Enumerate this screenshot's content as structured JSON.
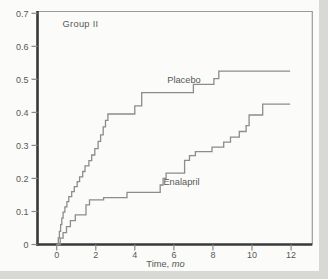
{
  "figure": {
    "background": "#fbfbf9",
    "scan_edge_color": "#d8d8d5"
  },
  "chart_data": {
    "type": "line",
    "subtype": "kaplan-meier-step",
    "title": "Group II",
    "xlabel": "Time,",
    "xlabel_unit": "mo",
    "ylabel": "",
    "xlim": [
      0,
      12
    ],
    "ylim": [
      0,
      0.7
    ],
    "grid": false,
    "legend_position": "inline-curve-labels",
    "axis_color": "#383838",
    "frame_color": "#9a9a9a",
    "tick_color": "#8a8a8a",
    "curve_color": "#8c8c8c",
    "text_color": "#585858",
    "x_ticks": [
      {
        "label": "0",
        "t": 0
      },
      {
        "label": "2",
        "t": 2
      },
      {
        "label": "4",
        "t": 4
      },
      {
        "label": "6",
        "t": 6
      },
      {
        "label": "8",
        "t": 8
      },
      {
        "label": "10",
        "t": 10
      },
      {
        "label": "12",
        "t": 12
      }
    ],
    "y_ticks": [
      {
        "label": "0.7",
        "v": 0.7
      },
      {
        "label": "0.6",
        "v": 0.6
      },
      {
        "label": "0.5",
        "v": 0.5
      },
      {
        "label": "0.4",
        "v": 0.4
      },
      {
        "label": "0.3",
        "v": 0.3
      },
      {
        "label": "0.2",
        "v": 0.2
      },
      {
        "label": "0.1",
        "v": 0.1
      },
      {
        "label": "0",
        "v": 0
      }
    ],
    "annotations": [
      {
        "text": "Group II",
        "t": 1.22,
        "v": 0.66
      }
    ],
    "series": [
      {
        "name": "Placebo",
        "label": {
          "text": "Placebo",
          "t": 6.52,
          "v": 0.489
        },
        "end_t": 11.95,
        "points": [
          [
            0,
            0
          ],
          [
            0.08,
            0.02
          ],
          [
            0.14,
            0.04
          ],
          [
            0.2,
            0.06
          ],
          [
            0.26,
            0.08
          ],
          [
            0.33,
            0.098
          ],
          [
            0.42,
            0.114
          ],
          [
            0.52,
            0.13
          ],
          [
            0.62,
            0.145
          ],
          [
            0.77,
            0.16
          ],
          [
            0.9,
            0.175
          ],
          [
            1.05,
            0.19
          ],
          [
            1.17,
            0.205
          ],
          [
            1.33,
            0.221
          ],
          [
            1.45,
            0.238
          ],
          [
            1.65,
            0.254
          ],
          [
            1.79,
            0.271
          ],
          [
            1.95,
            0.29
          ],
          [
            2.12,
            0.312
          ],
          [
            2.25,
            0.332
          ],
          [
            2.38,
            0.356
          ],
          [
            2.5,
            0.376
          ],
          [
            2.62,
            0.395
          ],
          [
            4.0,
            0.42
          ],
          [
            4.35,
            0.46
          ],
          [
            7.0,
            0.485
          ],
          [
            8.05,
            0.502
          ],
          [
            8.3,
            0.525
          ]
        ]
      },
      {
        "name": "Enalapril",
        "label": {
          "text": "Enalapril",
          "t": 6.39,
          "v": 0.179
        },
        "end_t": 11.95,
        "points": [
          [
            0,
            0
          ],
          [
            0.18,
            0.019
          ],
          [
            0.33,
            0.036
          ],
          [
            0.5,
            0.054
          ],
          [
            0.7,
            0.072
          ],
          [
            0.95,
            0.09
          ],
          [
            1.5,
            0.12
          ],
          [
            1.68,
            0.135
          ],
          [
            2.4,
            0.142
          ],
          [
            3.6,
            0.158
          ],
          [
            5.3,
            0.18
          ],
          [
            5.45,
            0.2
          ],
          [
            5.6,
            0.216
          ],
          [
            6.55,
            0.255
          ],
          [
            6.8,
            0.269
          ],
          [
            7.1,
            0.281
          ],
          [
            7.95,
            0.295
          ],
          [
            8.55,
            0.31
          ],
          [
            8.9,
            0.325
          ],
          [
            9.35,
            0.342
          ],
          [
            9.7,
            0.36
          ],
          [
            9.85,
            0.392
          ],
          [
            10.55,
            0.425
          ]
        ]
      }
    ]
  }
}
